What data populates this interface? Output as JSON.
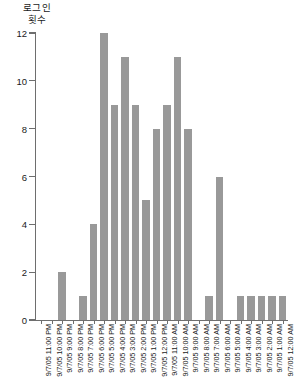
{
  "chart_data": {
    "type": "bar",
    "title": "",
    "ylabel": "로그인\n횟수",
    "xlabel": "",
    "ylim": [
      0,
      12
    ],
    "yticks": [
      0,
      2,
      4,
      6,
      8,
      10,
      12
    ],
    "grid": false,
    "legend": null,
    "bar_color": "#999999",
    "axis_color": "#6e6e6e",
    "categories": [
      "9/7/05 11:00 PM",
      "9/7/05 10:00 PM",
      "9/7/05 9:00 PM",
      "9/7/05 8:00 PM",
      "9/7/05 7:00 PM",
      "9/7/05 6:00 PM",
      "9/7/05 5:00 PM",
      "9/7/05 4:00 PM",
      "9/7/05 3:00 PM",
      "9/7/05 2:00 PM",
      "9/7/05 1:00 PM",
      "9/7/05 12:00 PM",
      "9/7/05 11:00 AM",
      "9/7/05 10:00 AM",
      "9/7/05 9:00 AM",
      "9/7/05 8:00 AM",
      "9/7/05 7:00 AM",
      "9/7/05 6:00 AM",
      "9/7/05 5:00 AM",
      "9/7/05 4:00 AM",
      "9/7/05 3:00 AM",
      "9/7/05 2:00 AM",
      "9/7/05 1:00 AM",
      "9/7/05 12:00 AM"
    ],
    "values": [
      0,
      0,
      2,
      0,
      1,
      4,
      12,
      9,
      11,
      9,
      5,
      8,
      9,
      11,
      8,
      0,
      1,
      6,
      0,
      1,
      1,
      1,
      1,
      1
    ]
  }
}
